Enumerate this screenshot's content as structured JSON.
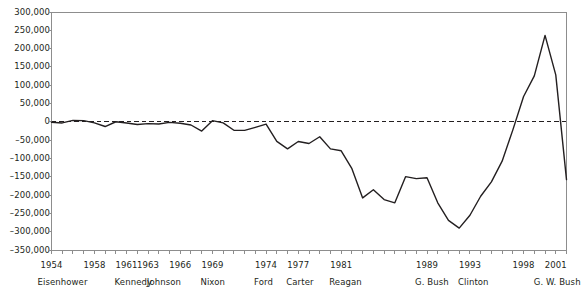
{
  "chart_data": {
    "type": "line",
    "title": "",
    "xlabel": "",
    "ylabel": "",
    "ylim": [
      -350000,
      300000
    ],
    "xlim": [
      1954,
      2002
    ],
    "grid": false,
    "legend": "none",
    "zero_reference_line": true,
    "line_color": "#231f20",
    "y_tick_labels": [
      "300,000",
      "250,000",
      "200,000",
      "150,000",
      "100,000",
      "50,000",
      "0",
      "–50,000",
      "–100,000",
      "–150,000",
      "–200,000",
      "–250,000",
      "–300,000",
      "–350,000"
    ],
    "y_tick_values": [
      300000,
      250000,
      200000,
      150000,
      100000,
      50000,
      0,
      -50000,
      -100000,
      -150000,
      -200000,
      -250000,
      -300000,
      -350000
    ],
    "x_tick_years": [
      1954,
      1955,
      1956,
      1957,
      1958,
      1959,
      1960,
      1961,
      1962,
      1963,
      1964,
      1965,
      1966,
      1967,
      1968,
      1969,
      1970,
      1971,
      1972,
      1973,
      1974,
      1975,
      1976,
      1977,
      1978,
      1979,
      1980,
      1981,
      1982,
      1983,
      1984,
      1985,
      1986,
      1987,
      1988,
      1989,
      1990,
      1991,
      1992,
      1993,
      1994,
      1995,
      1996,
      1997,
      1998,
      1999,
      2000,
      2001,
      2002
    ],
    "x_labeled_years": [
      {
        "year": 1954,
        "label": "1954"
      },
      {
        "year": 1958,
        "label": "1958"
      },
      {
        "year": 1961,
        "label": "1961"
      },
      {
        "year": 1963,
        "label": "1963"
      },
      {
        "year": 1966,
        "label": "1966"
      },
      {
        "year": 1969,
        "label": "1969"
      },
      {
        "year": 1974,
        "label": "1974"
      },
      {
        "year": 1977,
        "label": "1977"
      },
      {
        "year": 1981,
        "label": "1981"
      },
      {
        "year": 1989,
        "label": "1989"
      },
      {
        "year": 1993,
        "label": "1993"
      },
      {
        "year": 1998,
        "label": "1998"
      },
      {
        "year": 2001,
        "label": "2001"
      }
    ],
    "administrations": [
      {
        "name": "Eisenhower",
        "start_year": 1954
      },
      {
        "name": "Kennedy",
        "start_year": 1961
      },
      {
        "name": "Johnson",
        "start_year": 1964
      },
      {
        "name": "Nixon",
        "start_year": 1969
      },
      {
        "name": "Ford",
        "start_year": 1974
      },
      {
        "name": "Carter",
        "start_year": 1977
      },
      {
        "name": "Reagan",
        "start_year": 1981
      },
      {
        "name": "G. Bush",
        "start_year": 1989
      },
      {
        "name": "Clinton",
        "start_year": 1993
      },
      {
        "name": "G. W. Bush",
        "start_year": 2001
      }
    ],
    "x": [
      1954,
      1955,
      1956,
      1957,
      1958,
      1959,
      1960,
      1961,
      1962,
      1963,
      1964,
      1965,
      1966,
      1967,
      1968,
      1969,
      1970,
      1971,
      1972,
      1973,
      1974,
      1975,
      1976,
      1977,
      1978,
      1979,
      1980,
      1981,
      1982,
      1983,
      1984,
      1985,
      1986,
      1987,
      1988,
      1989,
      1990,
      1991,
      1992,
      1993,
      1994,
      1995,
      1996,
      1997,
      1998,
      1999,
      2000,
      2001,
      2002
    ],
    "values": [
      -1200,
      -3000,
      3900,
      3400,
      -2800,
      -12800,
      300,
      -3300,
      -7100,
      -4800,
      -5900,
      -1400,
      -3700,
      -8600,
      -25200,
      3200,
      -2800,
      -23000,
      -23400,
      -14900,
      -6100,
      -53200,
      -73700,
      -53700,
      -59200,
      -40700,
      -73800,
      -79000,
      -128000,
      -207800,
      -185400,
      -212300,
      -221200,
      -149700,
      -155200,
      -152600,
      -221200,
      -269200,
      -290300,
      -255100,
      -203200,
      -164000,
      -107400,
      -21900,
      69300,
      125600,
      236200,
      128200,
      -157800
    ],
    "series_name": "Federal budget surplus or deficit",
    "units": "millions of dollars"
  }
}
